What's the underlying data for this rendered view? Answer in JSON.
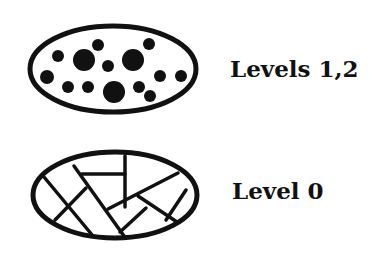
{
  "diagram": {
    "panels": [
      {
        "id": "particles",
        "label": "Levels 1,2",
        "shape": "ellipse-with-dots",
        "ellipse": {
          "cx": 113,
          "cy": 69,
          "rx": 83,
          "ry": 43
        },
        "dots": [
          {
            "cx": 58,
            "cy": 56,
            "r": 6
          },
          {
            "cx": 84,
            "cy": 60,
            "r": 11
          },
          {
            "cx": 98,
            "cy": 45,
            "r": 6
          },
          {
            "cx": 108,
            "cy": 66,
            "r": 6
          },
          {
            "cx": 133,
            "cy": 60,
            "r": 11
          },
          {
            "cx": 149,
            "cy": 44,
            "r": 6
          },
          {
            "cx": 47,
            "cy": 77,
            "r": 7
          },
          {
            "cx": 68,
            "cy": 87,
            "r": 6
          },
          {
            "cx": 88,
            "cy": 87,
            "r": 6
          },
          {
            "cx": 114,
            "cy": 92,
            "r": 11
          },
          {
            "cx": 139,
            "cy": 87,
            "r": 6
          },
          {
            "cx": 160,
            "cy": 76,
            "r": 6
          },
          {
            "cx": 181,
            "cy": 76,
            "r": 6
          },
          {
            "cx": 150,
            "cy": 96,
            "r": 6
          }
        ]
      },
      {
        "id": "cracks",
        "label": "Level 0",
        "shape": "ellipse-with-lines",
        "ellipse": {
          "cx": 115,
          "cy": 195,
          "rx": 82,
          "ry": 43
        },
        "lines": [
          {
            "x1": 44,
            "y1": 177,
            "x2": 93,
            "y2": 236
          },
          {
            "x1": 55,
            "y1": 220,
            "x2": 86,
            "y2": 188
          },
          {
            "x1": 74,
            "y1": 166,
            "x2": 124,
            "y2": 236
          },
          {
            "x1": 82,
            "y1": 174,
            "x2": 125,
            "y2": 174
          },
          {
            "x1": 125,
            "y1": 156,
            "x2": 125,
            "y2": 207
          },
          {
            "x1": 108,
            "y1": 209,
            "x2": 178,
            "y2": 173
          },
          {
            "x1": 120,
            "y1": 232,
            "x2": 146,
            "y2": 208
          },
          {
            "x1": 138,
            "y1": 196,
            "x2": 177,
            "y2": 222
          },
          {
            "x1": 166,
            "y1": 220,
            "x2": 186,
            "y2": 190
          }
        ]
      }
    ],
    "colors": {
      "stroke": "#111111",
      "background": "#ffffff"
    }
  }
}
